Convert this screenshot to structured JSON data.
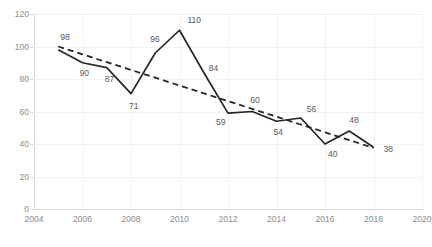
{
  "chart_data": {
    "type": "line",
    "title": "",
    "subtitle": "",
    "xlabel": "",
    "ylabel": "",
    "xlim": [
      2004,
      2020
    ],
    "ylim": [
      0,
      120
    ],
    "ytick_step": 20,
    "xtick_step": 2,
    "grid": true,
    "legend": "none",
    "x": [
      2005,
      2006,
      2007,
      2008,
      2009,
      2010,
      2011,
      2012,
      2013,
      2014,
      2015,
      2016,
      2017,
      2018
    ],
    "series": [
      {
        "name": "data",
        "style": "solid",
        "color": "#262626",
        "values": [
          98,
          90,
          87,
          71,
          96,
          110,
          84,
          59,
          60,
          54,
          56,
          40,
          48,
          38
        ]
      },
      {
        "name": "trendline",
        "style": "dashed",
        "color": "#262626",
        "values": [
          100,
          95.2,
          90.4,
          85.6,
          80.8,
          76,
          71.2,
          66.4,
          61.6,
          56.8,
          52,
          47.2,
          42.4,
          37.6
        ]
      }
    ],
    "point_labels": [
      {
        "value": "98",
        "x": 2005,
        "y": 98,
        "dx": 2,
        "dy": -12
      },
      {
        "value": "90",
        "x": 2006,
        "y": 90,
        "dx": -3,
        "dy": 11
      },
      {
        "value": "87",
        "x": 2007,
        "y": 87,
        "dx": -2,
        "dy": 12
      },
      {
        "value": "71",
        "x": 2008,
        "y": 71,
        "dx": -2,
        "dy": 13
      },
      {
        "value": "96",
        "x": 2009,
        "y": 96,
        "dx": -5,
        "dy": -13
      },
      {
        "value": "110",
        "x": 2010,
        "y": 110,
        "dx": 8,
        "dy": -9
      },
      {
        "value": "84",
        "x": 2011,
        "y": 84,
        "dx": 5,
        "dy": -4
      },
      {
        "value": "59",
        "x": 2012,
        "y": 59,
        "dx": -12,
        "dy": 10
      },
      {
        "value": "60",
        "x": 2013,
        "y": 60,
        "dx": -2,
        "dy": -11
      },
      {
        "value": "54",
        "x": 2014,
        "y": 54,
        "dx": -3,
        "dy": 12
      },
      {
        "value": "56",
        "x": 2015,
        "y": 56,
        "dx": 6,
        "dy": -8
      },
      {
        "value": "40",
        "x": 2016,
        "y": 40,
        "dx": 3,
        "dy": 11
      },
      {
        "value": "48",
        "x": 2017,
        "y": 48,
        "dx": 0,
        "dy": -10
      },
      {
        "value": "38",
        "x": 2018,
        "y": 38,
        "dx": 10,
        "dy": 3
      }
    ],
    "yticks": [
      "0",
      "20",
      "40",
      "60",
      "80",
      "100",
      "120"
    ],
    "ytick_values": [
      0,
      20,
      40,
      60,
      80,
      100,
      120
    ],
    "xticks": [
      "2004",
      "2006",
      "2008",
      "2010",
      "2012",
      "2014",
      "2016",
      "2018",
      "2020"
    ],
    "xtick_values": [
      2004,
      2006,
      2008,
      2010,
      2012,
      2014,
      2016,
      2018,
      2020
    ]
  },
  "colors": {
    "line": "#262626",
    "grid": "#f2f2f2",
    "axis": "#d9d9d9",
    "tick_text": "#8c8c8c",
    "label_text": "#595959",
    "background": "#ffffff"
  }
}
